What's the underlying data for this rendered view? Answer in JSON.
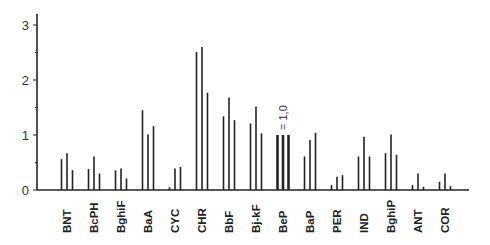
{
  "chart_data": {
    "type": "bar",
    "title": "",
    "xlabel": "",
    "ylabel": "",
    "ylim": [
      0,
      3.2
    ],
    "yticks": [
      0,
      1,
      2,
      3
    ],
    "yminor_ticks": [
      0.5,
      1.5,
      2.5
    ],
    "grid": false,
    "legend": null,
    "bars_per_group": 3,
    "categories": [
      "BNT",
      "BcPH",
      "BghiF",
      "BaA",
      "CYC",
      "CHR",
      "BbF",
      "Bj-kF",
      "BeP",
      "BaP",
      "PER",
      "IND",
      "BghiP",
      "ANT",
      "COR"
    ],
    "series": [
      {
        "name": "bar1",
        "values": [
          0.56,
          0.38,
          0.36,
          1.45,
          0.05,
          2.51,
          1.34,
          1.21,
          1.0,
          0.61,
          0.09,
          0.61,
          0.67,
          0.09,
          0.15
        ]
      },
      {
        "name": "bar2",
        "values": [
          0.67,
          0.61,
          0.39,
          1.01,
          0.39,
          2.6,
          1.68,
          1.52,
          1.0,
          0.91,
          0.24,
          0.97,
          1.01,
          0.3,
          0.3
        ]
      },
      {
        "name": "bar3",
        "values": [
          0.36,
          0.3,
          0.21,
          1.16,
          0.42,
          1.77,
          1.27,
          1.03,
          1.0,
          1.04,
          0.27,
          0.61,
          0.64,
          0.06,
          0.07
        ]
      }
    ],
    "reference_category": "BeP",
    "annotations": [
      {
        "text": "= 1,0",
        "category": "BeP",
        "rotation": -90
      }
    ]
  },
  "style": {
    "bar_color": "#222222",
    "axis_color": "#222222",
    "text_color": "#333333"
  }
}
